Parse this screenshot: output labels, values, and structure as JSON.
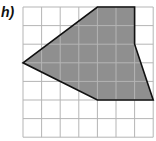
{
  "label": "h)",
  "grid": {
    "cols": 7,
    "rows": 7,
    "origin_x": 23,
    "origin_y": 7,
    "cell": 18.6,
    "line_color": "#b5b5b5"
  },
  "polygon": {
    "vertices_grid": [
      [
        4,
        0
      ],
      [
        6,
        0
      ],
      [
        6,
        2
      ],
      [
        7,
        5
      ],
      [
        4,
        5
      ],
      [
        0,
        3
      ]
    ],
    "fill": "#8f8f8f",
    "stroke": "#111111"
  }
}
